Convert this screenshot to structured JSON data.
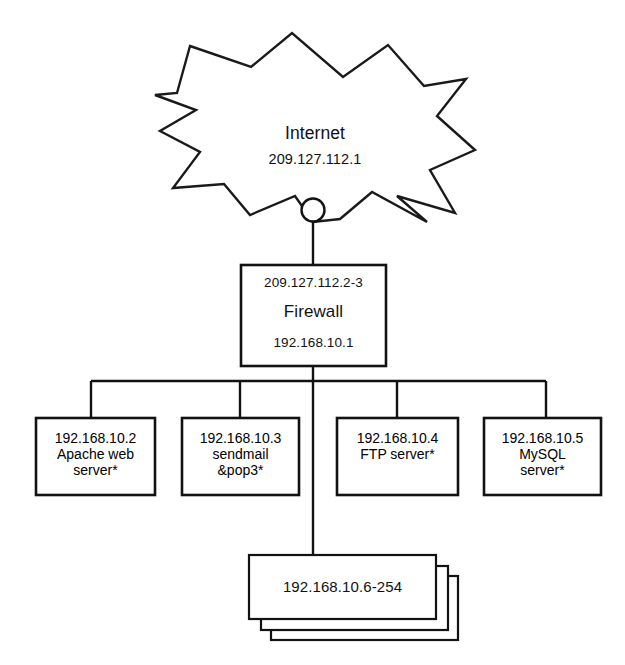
{
  "diagram": {
    "cloud": {
      "name": "Internet",
      "ip": "209.127.112.1",
      "shape": "starburst-cloud"
    },
    "firewall": {
      "external_ip": "209.127.112.2-3",
      "name": "Firewall",
      "internal_ip": "192.168.10.1"
    },
    "servers": [
      {
        "ip": "192.168.10.2",
        "line2": "Apache web",
        "line3": "server*"
      },
      {
        "ip": "192.168.10.3",
        "line2": "sendmail",
        "line3": "&pop3*"
      },
      {
        "ip": "192.168.10.4",
        "line2": "FTP server*",
        "line3": ""
      },
      {
        "ip": "192.168.10.5",
        "line2": "MySQL",
        "line3": "server*"
      }
    ],
    "workstations": {
      "ip_range": "192.168.10.6-254",
      "stack_count": 3
    },
    "colors": {
      "stroke": "#121212",
      "background": "#ffffff",
      "text": "#111111"
    }
  }
}
